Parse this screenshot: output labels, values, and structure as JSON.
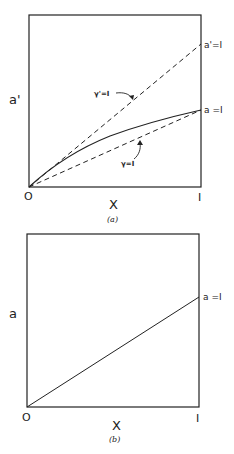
{
  "colors": {
    "ink": "#222222",
    "background": "#ffffff"
  },
  "panel_a": {
    "caption": "(a)",
    "y_axis_label": "a'",
    "x_axis_label": "X",
    "origin_label": "O",
    "x_end_label": "I",
    "upper_line_end_label": "a'=I",
    "lower_line_end_label": "a =I",
    "upper_dashed_label": "γ'=I",
    "lower_dashed_label": "γ=I",
    "curves": [
      {
        "name": "gamma-prime-equals-1",
        "style": "dashed",
        "from": [
          0,
          0
        ],
        "to": [
          1,
          0.83
        ]
      },
      {
        "name": "a-curve",
        "style": "solid",
        "shape": "concave",
        "from": [
          0,
          0
        ],
        "to": [
          1,
          0.45
        ]
      },
      {
        "name": "gamma-equals-1",
        "style": "dashed",
        "from": [
          0,
          0
        ],
        "to": [
          1,
          0.45
        ]
      }
    ]
  },
  "panel_b": {
    "caption": "(b)",
    "y_axis_label": "a",
    "x_axis_label": "X",
    "origin_label": "O",
    "x_end_label": "I",
    "line_end_label": "a =I",
    "curves": [
      {
        "name": "a-line",
        "style": "solid",
        "from": [
          0,
          0
        ],
        "to": [
          1,
          0.64
        ]
      }
    ]
  }
}
